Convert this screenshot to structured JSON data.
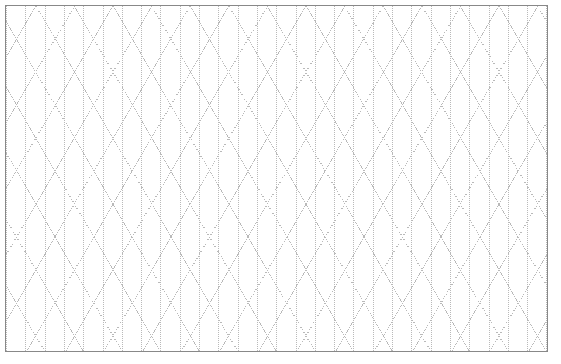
{
  "page": {
    "kind": "isometric-triangle-dot-grid-paper",
    "width": 561,
    "height": 364,
    "background_color": "#ffffff"
  },
  "sheet": {
    "x": 5,
    "y": 5,
    "width": 543,
    "height": 347,
    "border_color": "#888888",
    "border_width": 1,
    "fill_color": "#ffffff"
  },
  "grid": {
    "dot_color": "#b9b9b9",
    "dot_size": 1,
    "dot_period": 2,
    "column_pitch": 19.3,
    "row_height": 33,
    "triangle_side": 38.6,
    "line_families": [
      {
        "name": "vertical",
        "angle_deg": 90
      },
      {
        "name": "diagonal-up",
        "angle_deg": 60
      },
      {
        "name": "diagonal-down",
        "angle_deg": -60
      }
    ],
    "columns": 28,
    "rows": 11
  },
  "labels": {
    "title": "",
    "caption": "",
    "axis_x": "",
    "axis_y": ""
  },
  "chart_data": {
    "type": "table",
    "title": "",
    "categories": [],
    "values": []
  }
}
